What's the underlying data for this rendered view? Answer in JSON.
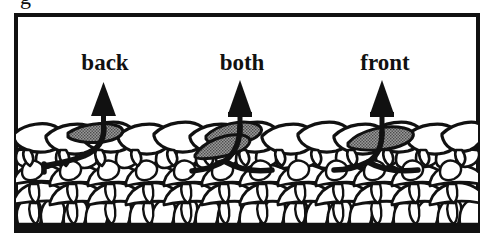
{
  "figure": {
    "type": "knitting-stitch-diagram",
    "caption_remnant": "g",
    "frame": {
      "border_color": "#111111",
      "border_width_px": 4,
      "fill": "#ffffff",
      "x": 14,
      "y": 13,
      "width": 466,
      "height": 220
    },
    "colors": {
      "ink": "#111111",
      "shaded_stitch": "#8a8a8a",
      "fabric_fill": "#ffffff",
      "background": "#ffffff"
    },
    "labels": [
      {
        "text": "back",
        "x": 105,
        "y": 70
      },
      {
        "text": "both",
        "x": 242,
        "y": 70
      },
      {
        "text": "front",
        "x": 385,
        "y": 70
      }
    ],
    "arrows": [
      {
        "name": "arrow-back",
        "x": 104,
        "tip_y": 84,
        "base_y": 134,
        "points_to": "back loop of stitch"
      },
      {
        "name": "arrow-both",
        "x": 240,
        "tip_y": 82,
        "base_y": 132,
        "points_to": "both loops of stitch"
      },
      {
        "name": "arrow-front",
        "x": 382,
        "tip_y": 82,
        "base_y": 134,
        "points_to": "front loop of stitch"
      }
    ],
    "shaded_stitches": [
      {
        "name": "shaded-stitch-back",
        "center_x": 110,
        "center_y": 136,
        "variant": "back"
      },
      {
        "name": "shaded-stitch-both",
        "center_x": 247,
        "center_y": 145,
        "variant": "both"
      },
      {
        "name": "shaded-stitch-front",
        "center_x": 390,
        "center_y": 143,
        "variant": "front"
      }
    ],
    "yarn_paths": [
      {
        "name": "yarn-path-back",
        "anchor_x": 104
      },
      {
        "name": "yarn-path-both",
        "anchor_x": 240
      },
      {
        "name": "yarn-path-front",
        "anchor_x": 382
      }
    ],
    "fabric": {
      "top_row_y": 128,
      "rows": 5,
      "stitches_per_row": 13,
      "description": "knitted fabric swatch, top row of knit V loops over dense purl rows"
    }
  }
}
